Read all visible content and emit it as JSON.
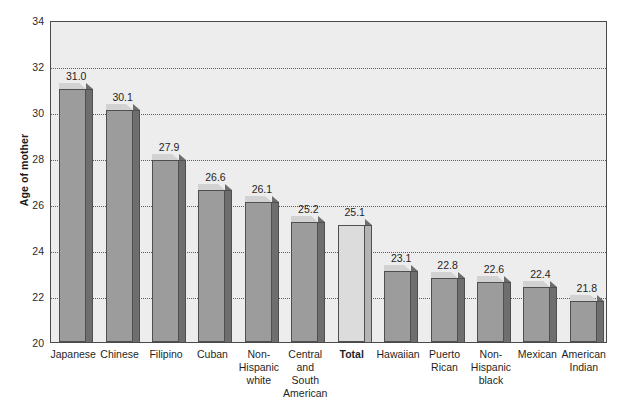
{
  "chart_data": {
    "type": "bar",
    "title": "",
    "subtitle": "",
    "xlabel": "",
    "ylabel": "Age of mother",
    "ylim": [
      20,
      34
    ],
    "ytick_step": 2,
    "yticks": [
      "20",
      "22",
      "24",
      "26",
      "28",
      "30",
      "32",
      "34"
    ],
    "grid": true,
    "grid_style": "dotted-horizontal",
    "legend": "none",
    "style": "3d-bars",
    "categories": [
      "Japanese",
      "Chinese",
      "Filipino",
      "Cuban",
      "Non-Hispanic white",
      "Central and South American",
      "Total",
      "Hawaiian",
      "Puerto Rican",
      "Non-Hispanic black",
      "Mexican",
      "American Indian"
    ],
    "category_lines": [
      [
        "Japanese"
      ],
      [
        "Chinese"
      ],
      [
        "Filipino"
      ],
      [
        "Cuban"
      ],
      [
        "Non-",
        "Hispanic",
        "white"
      ],
      [
        "Central",
        "and",
        "South",
        "American"
      ],
      [
        "Total"
      ],
      [
        "Hawaiian"
      ],
      [
        "Puerto",
        "Rican"
      ],
      [
        "Non-",
        "Hispanic",
        "black"
      ],
      [
        "Mexican"
      ],
      [
        "American",
        "Indian"
      ]
    ],
    "values": [
      31.0,
      30.1,
      27.9,
      26.6,
      26.1,
      25.2,
      25.1,
      23.1,
      22.8,
      22.6,
      22.4,
      21.8
    ],
    "value_labels": [
      "31.0",
      "30.1",
      "27.9",
      "26.6",
      "26.1",
      "25.2",
      "25.1",
      "23.1",
      "22.8",
      "22.6",
      "22.4",
      "21.8"
    ],
    "highlight_index": 6,
    "highlight_label_bold": true,
    "colors": {
      "bar_front": "#9c9c9c",
      "bar_top": "#d2d2d2",
      "bar_side": "#6e6e6e",
      "bar_outline": "#4f4f4f",
      "total_bar_front": "#dcdcdc",
      "total_bar_side": "#b4b4b4",
      "plot_background": "#ededed",
      "page_background": "#ffffff",
      "grid": "#5d5d5d",
      "axis": "#4a4a4a",
      "text": "#1f1f1f"
    }
  }
}
